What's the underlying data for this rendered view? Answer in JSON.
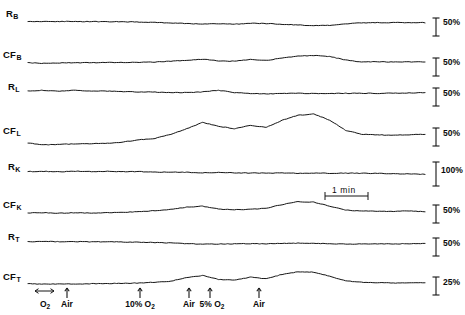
{
  "figure": {
    "width": 465,
    "height": 315,
    "background": "#ffffff",
    "ink_color": "#141414"
  },
  "chart_data": {
    "type": "line",
    "title": "",
    "subtitle": "",
    "xlabel": "",
    "ylabel": "",
    "grid": false,
    "legend_position": "none",
    "x": [
      0,
      0.04,
      0.08,
      0.12,
      0.16,
      0.2,
      0.24,
      0.28,
      0.32,
      0.36,
      0.4,
      0.44,
      0.48,
      0.52,
      0.56,
      0.6,
      0.64,
      0.68,
      0.72,
      0.76,
      0.8,
      0.84,
      0.88,
      0.92,
      0.96,
      1.0
    ],
    "xlim": [
      0,
      1
    ],
    "ylim": [
      -1,
      1
    ],
    "series": [
      {
        "name": "R_B",
        "label": "R",
        "subscript": "B",
        "scale_label": "50%",
        "scale_percent": 50,
        "baseline_y": 22,
        "amplitude_px": 11,
        "values": [
          0.06,
          0.05,
          0.05,
          0.04,
          0.04,
          0.03,
          0.02,
          0.0,
          -0.04,
          -0.09,
          -0.14,
          -0.2,
          -0.16,
          -0.2,
          -0.12,
          -0.14,
          -0.2,
          -0.27,
          -0.33,
          -0.3,
          -0.16,
          -0.08,
          -0.06,
          -0.05,
          -0.05,
          -0.06
        ]
      },
      {
        "name": "CF_B",
        "label": "CF",
        "subscript": "B",
        "scale_label": "50%",
        "scale_percent": 50,
        "baseline_y": 62,
        "amplitude_px": 13,
        "values": [
          -0.06,
          -0.1,
          -0.07,
          -0.06,
          -0.05,
          -0.04,
          -0.03,
          -0.02,
          0.0,
          0.06,
          0.14,
          0.22,
          0.08,
          0.06,
          0.2,
          0.12,
          0.3,
          0.45,
          0.5,
          0.42,
          0.16,
          0.0,
          0.02,
          0.0,
          0.01,
          0.0
        ]
      },
      {
        "name": "R_L",
        "label": "R",
        "subscript": "L",
        "scale_label": "50%",
        "scale_percent": 50,
        "baseline_y": 93,
        "amplitude_px": 9,
        "values": [
          0.24,
          0.3,
          0.2,
          0.3,
          0.22,
          0.2,
          0.16,
          0.12,
          0.1,
          0.04,
          0.05,
          0.12,
          0.3,
          0.04,
          -0.05,
          -0.1,
          -0.06,
          -0.04,
          -0.05,
          -0.05,
          -0.04,
          -0.03,
          -0.04,
          -0.02,
          0.0,
          0.04
        ]
      },
      {
        "name": "CF_L",
        "label": "CF",
        "subscript": "L",
        "scale_label": "50%",
        "scale_percent": 50,
        "baseline_y": 137,
        "amplitude_px": 28,
        "values": [
          -0.22,
          -0.28,
          -0.26,
          -0.25,
          -0.24,
          -0.22,
          -0.18,
          -0.1,
          -0.05,
          0.1,
          0.3,
          0.52,
          0.38,
          0.3,
          0.42,
          0.34,
          0.6,
          0.78,
          0.82,
          0.6,
          0.24,
          0.1,
          0.08,
          0.06,
          0.08,
          0.1
        ]
      },
      {
        "name": "R_K",
        "label": "R",
        "subscript": "K",
        "scale_label": "100%",
        "scale_percent": 100,
        "baseline_y": 173,
        "amplitude_px": 7,
        "values": [
          0.2,
          0.24,
          0.18,
          0.26,
          0.2,
          0.24,
          0.18,
          0.2,
          0.14,
          0.12,
          0.1,
          0.04,
          0.08,
          0.02,
          0.0,
          -0.02,
          0.0,
          -0.04,
          -0.02,
          -0.04,
          -0.02,
          -0.04,
          -0.06,
          -0.1,
          -0.14,
          -0.18
        ]
      },
      {
        "name": "CF_K",
        "label": "CF",
        "subscript": "K",
        "scale_label": "50%",
        "scale_percent": 50,
        "baseline_y": 211,
        "amplitude_px": 16,
        "values": [
          -0.12,
          -0.1,
          -0.14,
          -0.1,
          -0.14,
          -0.1,
          -0.08,
          -0.04,
          0.02,
          0.1,
          0.24,
          0.3,
          0.12,
          0.08,
          0.1,
          0.18,
          0.4,
          0.58,
          0.55,
          0.3,
          0.06,
          0.0,
          -0.02,
          -0.02,
          0.0,
          -0.04
        ]
      },
      {
        "name": "R_T",
        "label": "R",
        "subscript": "T",
        "scale_label": "50%",
        "scale_percent": 50,
        "baseline_y": 243,
        "amplitude_px": 8,
        "values": [
          0.16,
          0.2,
          0.16,
          0.18,
          0.14,
          0.16,
          0.12,
          0.1,
          0.06,
          0.0,
          -0.08,
          -0.14,
          -0.12,
          -0.1,
          -0.08,
          -0.1,
          -0.06,
          -0.02,
          -0.04,
          -0.1,
          -0.14,
          -0.12,
          -0.1,
          -0.12,
          -0.08,
          -0.06
        ]
      },
      {
        "name": "CF_T",
        "label": "CF",
        "subscript": "T",
        "scale_label": "25%",
        "scale_percent": 25,
        "baseline_y": 283,
        "amplitude_px": 18,
        "values": [
          -0.04,
          -0.06,
          -0.05,
          -0.06,
          -0.04,
          -0.03,
          -0.02,
          0.0,
          0.04,
          0.1,
          0.3,
          0.42,
          0.2,
          0.16,
          0.32,
          0.24,
          0.48,
          0.62,
          0.6,
          0.38,
          0.12,
          0.04,
          0.02,
          0.0,
          0.02,
          0.0
        ]
      }
    ],
    "events": [
      {
        "label": "O",
        "subscript": "2",
        "x_px": 45,
        "marker": "double-arrow"
      },
      {
        "label": "Air",
        "subscript": "",
        "x_px": 67,
        "marker": "up-arrow"
      },
      {
        "label": "10% O",
        "subscript": "2",
        "x_px": 140,
        "marker": "up-arrow"
      },
      {
        "label": "Air",
        "subscript": "",
        "x_px": 189,
        "marker": "up-arrow"
      },
      {
        "label": "5% O",
        "subscript": "2",
        "x_px": 210,
        "marker": "up-arrow"
      },
      {
        "label": "Air",
        "subscript": "",
        "x_px": 259,
        "marker": "up-arrow"
      }
    ],
    "time_calibration": {
      "label": "1 min",
      "x_start_px": 325,
      "x_end_px": 368,
      "y_px": 196
    }
  },
  "axes": {
    "trace_x_start": 28,
    "trace_x_end": 425,
    "scale_bar_x": 436,
    "scale_label_x": 443
  }
}
